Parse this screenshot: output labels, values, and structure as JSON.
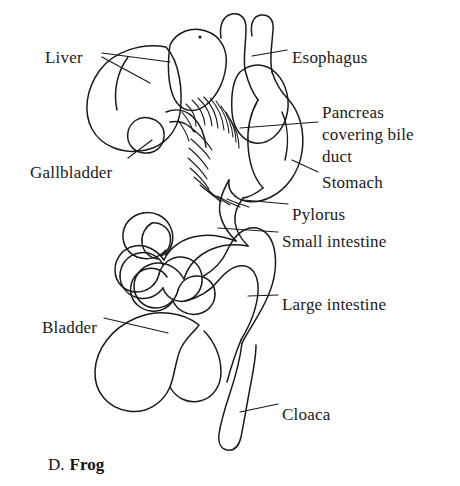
{
  "figure": {
    "caption_letter": "D.",
    "caption_name": "Frog"
  },
  "labels": [
    {
      "id": "liver",
      "text": "Liver",
      "x": 45,
      "y": 48
    },
    {
      "id": "esophagus",
      "text": "Esophagus",
      "x": 292,
      "y": 48
    },
    {
      "id": "pancreas1",
      "text": "Pancreas",
      "x": 322,
      "y": 103
    },
    {
      "id": "pancreas2",
      "text": "covering bile",
      "x": 322,
      "y": 125
    },
    {
      "id": "pancreas3",
      "text": "duct",
      "x": 322,
      "y": 147
    },
    {
      "id": "gallbladder",
      "text": "Gallbladder",
      "x": 30,
      "y": 163
    },
    {
      "id": "stomach",
      "text": "Stomach",
      "x": 322,
      "y": 173
    },
    {
      "id": "pylorus",
      "text": "Pylorus",
      "x": 292,
      "y": 205
    },
    {
      "id": "small-intestine",
      "text": "Small intestine",
      "x": 282,
      "y": 232
    },
    {
      "id": "large-intestine",
      "text": "Large intestine",
      "x": 282,
      "y": 295
    },
    {
      "id": "bladder",
      "text": "Bladder",
      "x": 42,
      "y": 318
    },
    {
      "id": "cloaca",
      "text": "Cloaca",
      "x": 282,
      "y": 405
    }
  ],
  "colors": {
    "ink": "#1a1a1a",
    "background": "#ffffff",
    "leader_line": "#1a1a1a"
  }
}
